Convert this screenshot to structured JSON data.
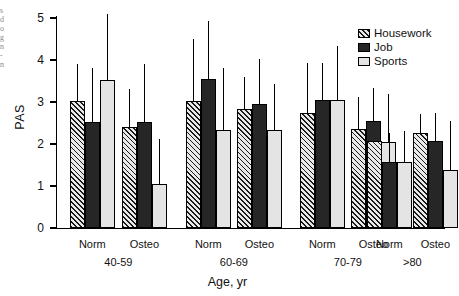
{
  "chart_data": {
    "type": "bar",
    "title": "",
    "subtitle": "",
    "xlabel": "Age, yr",
    "ylabel": "PAS",
    "ylim": [
      0,
      5
    ],
    "yticks": [
      0,
      1,
      2,
      3,
      4,
      5
    ],
    "grid": false,
    "legend_position": "top-right",
    "error_bars": "upper-only vertical lines (no caps)",
    "categories": [
      "40-59 Norm",
      "40-59 Osteo",
      "60-69 Norm",
      "60-69 Osteo",
      "70-79 Norm",
      "70-79 Osteo",
      ">80 Norm",
      ">80 Osteo"
    ],
    "group_labels": [
      "40-59",
      "60-69",
      "70-79",
      ">80"
    ],
    "subgroup_labels": [
      "Norm",
      "Osteo"
    ],
    "series": [
      {
        "name": "Housework",
        "fill": "diagonal-hatch",
        "color": "#e9e9e9",
        "values": [
          3.02,
          2.41,
          3.03,
          2.84,
          2.74,
          2.35,
          2.06,
          2.26
        ],
        "error_upper": [
          3.9,
          3.31,
          4.51,
          3.6,
          3.92,
          3.12,
          2.06,
          2.72
        ]
      },
      {
        "name": "Job",
        "fill": "solid-dark",
        "color": "#262626",
        "values": [
          2.52,
          2.53,
          3.54,
          2.95,
          3.05,
          2.55,
          1.56,
          2.07
        ],
        "error_upper": [
          3.81,
          3.9,
          4.93,
          4.03,
          3.93,
          3.34,
          2.26,
          2.74
        ]
      },
      {
        "name": "Sports",
        "fill": "light-empty",
        "color": "#e4e4e4",
        "values": [
          3.52,
          1.04,
          2.33,
          2.34,
          3.05,
          2.05,
          1.57,
          1.37
        ],
        "error_upper": [
          5.1,
          2.11,
          3.82,
          3.43,
          4.34,
          3.2,
          2.32,
          2.54
        ]
      }
    ]
  },
  "axes": {
    "y_title": "PAS",
    "x_title": "Age, yr",
    "y_tick_labels": [
      "0",
      "1",
      "2",
      "3",
      "4",
      "5"
    ]
  },
  "legend": {
    "items": [
      {
        "label": "Housework",
        "swatch": "hatch-swatch"
      },
      {
        "label": "Job",
        "swatch": "solid-swatch"
      },
      {
        "label": "Sports",
        "swatch": "empty-swatch"
      }
    ]
  },
  "x_groups": [
    {
      "group": "40-59",
      "left": "Norm",
      "right": "Osteo"
    },
    {
      "group": "60-69",
      "left": "Norm",
      "right": "Osteo"
    },
    {
      "group": "70-79",
      "left": "Norm",
      "right": "Osteo"
    },
    {
      "group": ">80",
      "left": "Norm",
      "right": "Osteo"
    }
  ],
  "edge_fragments": [
    "s",
    "d",
    "o",
    "g",
    "n",
    "-",
    "n"
  ]
}
